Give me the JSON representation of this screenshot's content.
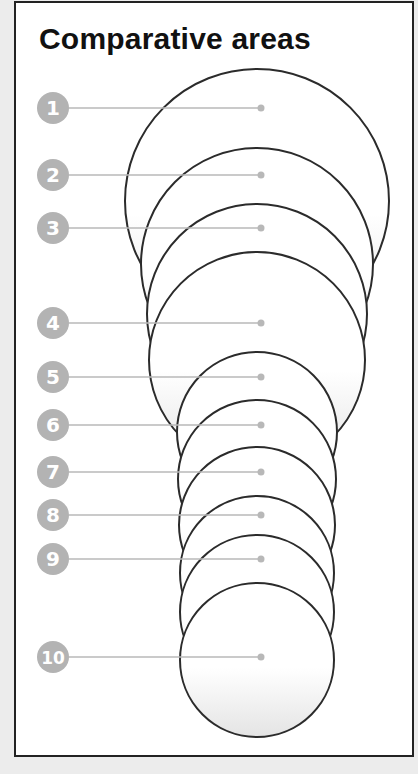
{
  "title": "Comparative areas",
  "colors": {
    "circle_stroke": "#2b2b2b",
    "circle_fill_top": "#ffffff",
    "circle_fill_bottom": "#e4e4e4",
    "badge_fill": "#b3b3b3",
    "badge_text": "#ffffff",
    "leader_line": "#b8b8b8"
  },
  "items": [
    {
      "label": "1"
    },
    {
      "label": "2"
    },
    {
      "label": "3"
    },
    {
      "label": "4"
    },
    {
      "label": "5"
    },
    {
      "label": "6"
    },
    {
      "label": "7"
    },
    {
      "label": "8"
    },
    {
      "label": "9"
    },
    {
      "label": "10"
    }
  ]
}
